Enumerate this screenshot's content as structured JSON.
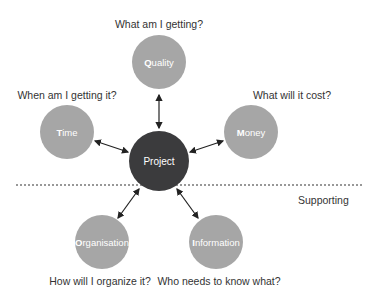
{
  "diagram": {
    "colors": {
      "outer_node": "#a6a6a6",
      "center_node": "#3b3b3d",
      "arrow": "#222222",
      "divider": "#333333",
      "label": "#333333"
    },
    "center": {
      "label": "Project"
    },
    "nodes": [
      {
        "id": "quality",
        "initial": "Q",
        "rest": "uality",
        "question": "What am I getting?"
      },
      {
        "id": "time",
        "initial": "T",
        "rest": "ime",
        "question": "When am I getting it?"
      },
      {
        "id": "money",
        "initial": "M",
        "rest": "oney",
        "question": "What will it cost?"
      },
      {
        "id": "organisation",
        "initial": "O",
        "rest": "rganisation",
        "question": "How will I organize it?"
      },
      {
        "id": "information",
        "initial": "I",
        "rest": "nformation",
        "question": "Who needs to know what?"
      }
    ],
    "divider_label": "Supporting"
  }
}
